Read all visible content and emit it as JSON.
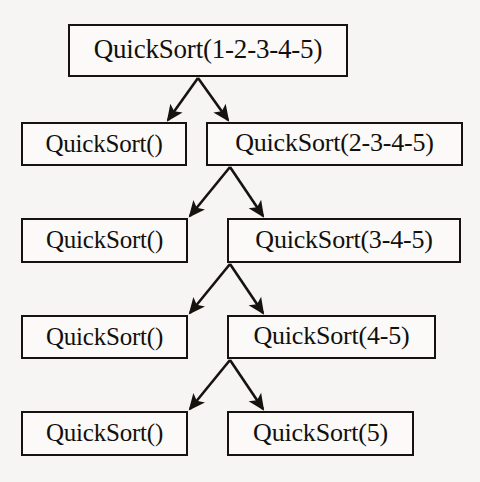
{
  "diagram": {
    "type": "recursion-tree",
    "background_color": "#f6f5f3",
    "box_fill_color": "#fbfaf8",
    "line_color": "#16130f",
    "text_color": "#12100d",
    "nodes": [
      {
        "id": "root",
        "label": "QuickSort(1-2-3-4-5)",
        "level": 0,
        "side": "root",
        "x": 68,
        "y": 24,
        "w": 280,
        "h": 53,
        "font_size": 27
      },
      {
        "id": "n1-left",
        "label": "QuickSort()",
        "level": 1,
        "side": "left",
        "x": 21,
        "y": 122,
        "w": 166,
        "h": 44,
        "font_size": 25
      },
      {
        "id": "n1-right",
        "label": "QuickSort(2-3-4-5)",
        "level": 1,
        "side": "right",
        "x": 206,
        "y": 122,
        "w": 257,
        "h": 44,
        "font_size": 26
      },
      {
        "id": "n2-left",
        "label": "QuickSort()",
        "level": 2,
        "side": "left",
        "x": 21,
        "y": 218,
        "w": 167,
        "h": 45,
        "font_size": 25
      },
      {
        "id": "n2-right",
        "label": "QuickSort(3-4-5)",
        "level": 2,
        "side": "right",
        "x": 227,
        "y": 218,
        "w": 234,
        "h": 45,
        "font_size": 26
      },
      {
        "id": "n3-left",
        "label": "QuickSort()",
        "level": 3,
        "side": "left",
        "x": 21,
        "y": 315,
        "w": 167,
        "h": 44,
        "font_size": 25
      },
      {
        "id": "n3-right",
        "label": "QuickSort(4-5)",
        "level": 3,
        "side": "right",
        "x": 227,
        "y": 315,
        "w": 209,
        "h": 44,
        "font_size": 26
      },
      {
        "id": "n4-left",
        "label": "QuickSort()",
        "level": 4,
        "side": "left",
        "x": 21,
        "y": 411,
        "w": 167,
        "h": 45,
        "font_size": 25
      },
      {
        "id": "n4-right",
        "label": "QuickSort(5)",
        "level": 4,
        "side": "right",
        "x": 227,
        "y": 411,
        "w": 187,
        "h": 45,
        "font_size": 26
      },
      {
        "id": "x1",
        "label": "",
        "level": 0,
        "side": "none",
        "x": 0,
        "y": 0,
        "w": 0,
        "h": 0,
        "font_size": 0
      }
    ],
    "edges": [
      {
        "id": "e-root-left",
        "from": "root",
        "to": "n1-left",
        "x1": 198,
        "y1": 78,
        "x2": 168,
        "y2": 120,
        "arrowhead": true
      },
      {
        "id": "e-root-right",
        "from": "root",
        "to": "n1-right",
        "x1": 198,
        "y1": 78,
        "x2": 228,
        "y2": 120,
        "arrowhead": true
      },
      {
        "id": "e-n1-left",
        "from": "n1-right",
        "to": "n2-left",
        "x1": 230,
        "y1": 167,
        "x2": 190,
        "y2": 216,
        "arrowhead": true
      },
      {
        "id": "e-n1-right",
        "from": "n1-right",
        "to": "n2-right",
        "x1": 230,
        "y1": 167,
        "x2": 263,
        "y2": 216,
        "arrowhead": true
      },
      {
        "id": "e-n2-left",
        "from": "n2-right",
        "to": "n3-left",
        "x1": 230,
        "y1": 264,
        "x2": 190,
        "y2": 313,
        "arrowhead": true
      },
      {
        "id": "e-n2-right",
        "from": "n2-right",
        "to": "n3-right",
        "x1": 230,
        "y1": 264,
        "x2": 263,
        "y2": 313,
        "arrowhead": true
      },
      {
        "id": "e-n3-left",
        "from": "n3-right",
        "to": "n4-left",
        "x1": 230,
        "y1": 360,
        "x2": 190,
        "y2": 409,
        "arrowhead": true
      },
      {
        "id": "e-n3-right",
        "from": "n3-right",
        "to": "n4-right",
        "x1": 230,
        "y1": 360,
        "x2": 263,
        "y2": 409,
        "arrowhead": true
      }
    ]
  }
}
